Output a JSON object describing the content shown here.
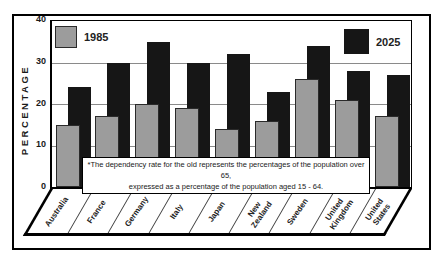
{
  "figure": {
    "y_axis_title": "PERCENTAGE",
    "note_line1": "*The dependency rate for the old represents the percentages of the population over 65,",
    "note_line2": "expressed as a percentage of the population aged 15 - 64."
  },
  "legend": {
    "label_1985": "1985",
    "label_2025": "2025"
  },
  "colors": {
    "bar_1985": "#9c9c9c",
    "bar_2025": "#161616",
    "gridline": "#8a8a8a",
    "frame": "#000000",
    "background": "#ffffff"
  },
  "chart_data": {
    "type": "bar",
    "categories": [
      "Australia",
      "France",
      "Germany",
      "Italy",
      "Japan",
      "New Zealand",
      "Sweden",
      "United Kingdom",
      "United States"
    ],
    "series": [
      {
        "name": "1985",
        "color": "#9c9c9c",
        "values": [
          15,
          17,
          20,
          19,
          14,
          16,
          26,
          21,
          17
        ]
      },
      {
        "name": "2025",
        "color": "#161616",
        "values": [
          24,
          30,
          35,
          30,
          32,
          23,
          34,
          28,
          27
        ]
      }
    ],
    "title": "",
    "xlabel": "",
    "ylabel": "PERCENTAGE",
    "ylim": [
      0,
      40
    ],
    "yticks": [
      0,
      10,
      20,
      30,
      40
    ],
    "grid": true,
    "legend_position": "top-corners",
    "note": "*The dependency rate for the old represents the percentages of the population over 65, expressed as a percentage of the population aged 15 - 64."
  }
}
